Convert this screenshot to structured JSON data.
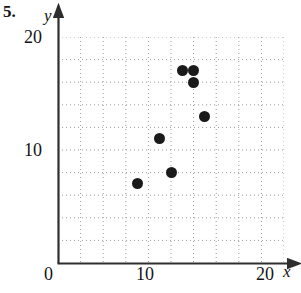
{
  "problem": {
    "number": "5."
  },
  "axes": {
    "x_name": "x",
    "y_name": "y",
    "x_ticks": [
      {
        "label": "0",
        "value": 0
      },
      {
        "label": "10",
        "value": 10
      },
      {
        "label": "20",
        "value": 20
      }
    ],
    "y_ticks": [
      {
        "label": "10",
        "value": 10
      },
      {
        "label": "20",
        "value": 20
      }
    ]
  },
  "chart_data": {
    "type": "scatter",
    "title": "",
    "xlabel": "x",
    "ylabel": "y",
    "xlim": [
      0,
      20
    ],
    "ylim": [
      0,
      20
    ],
    "grid": true,
    "grid_style": "dotted",
    "legend": null,
    "xticks": [
      0,
      10,
      20
    ],
    "yticks": [
      10,
      20
    ],
    "minor_gridline_step": 2,
    "marker": {
      "shape": "circle",
      "color": "#1a1a1a",
      "size": 11
    },
    "points": [
      {
        "x": 7,
        "y": 7
      },
      {
        "x": 9,
        "y": 11
      },
      {
        "x": 10,
        "y": 8
      },
      {
        "x": 13,
        "y": 13
      },
      {
        "x": 11,
        "y": 17
      },
      {
        "x": 12,
        "y": 17
      },
      {
        "x": 12,
        "y": 16
      }
    ],
    "colors": {
      "marker": "#1a1a1a",
      "axis": "#3a3a3a",
      "grid": "#9a9a9a",
      "background": "#ffffff"
    }
  }
}
